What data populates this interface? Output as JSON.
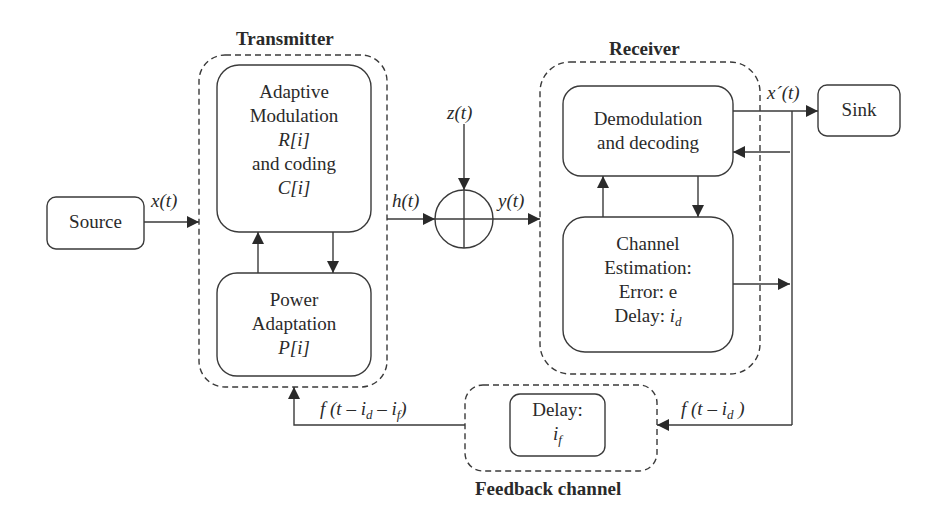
{
  "figure": {
    "type": "block-diagram",
    "groups": {
      "transmitter": {
        "title": "Transmitter"
      },
      "receiver": {
        "title": "Receiver"
      },
      "feedback": {
        "title": "Feedback channel"
      }
    },
    "blocks": {
      "source": {
        "label": "Source"
      },
      "sink": {
        "label": "Sink"
      },
      "adaptive_modulation": {
        "line1": "Adaptive",
        "line2": "Modulation",
        "line3": "R[i]",
        "line4": "and coding",
        "line5": "C[i]"
      },
      "power_adaptation": {
        "line1": "Power",
        "line2": "Adaptation",
        "line3": "P[i]"
      },
      "demodulation": {
        "line1": "Demodulation",
        "line2": "and decoding"
      },
      "channel_estimation": {
        "line1": "Channel",
        "line2": "Estimation:",
        "line3": "Error: e",
        "line4_prefix": "Delay: ",
        "line4_var": "i",
        "line4_sub": "d"
      },
      "feedback_delay": {
        "line1": "Delay:",
        "line2_var": "i",
        "line2_sub": "f"
      },
      "summing_junction": {
        "symbol": "⊕"
      }
    },
    "signals": {
      "x": "x(t)",
      "h": "h(t)",
      "z": "z(t)",
      "y": "y(t)",
      "x_hat": "x´(t)",
      "f_id_prefix": "f (t – i",
      "f_id_sub": "d",
      "f_id_suffix": " )",
      "f_idf_prefix": "f (t – i",
      "f_idf_sub1": "d",
      "f_idf_mid": " – i",
      "f_idf_sub2": "f",
      "f_idf_suffix": ")"
    },
    "colors": {
      "stroke": "#3a3a3a",
      "text": "#2a2a2a",
      "background": "#ffffff"
    }
  }
}
